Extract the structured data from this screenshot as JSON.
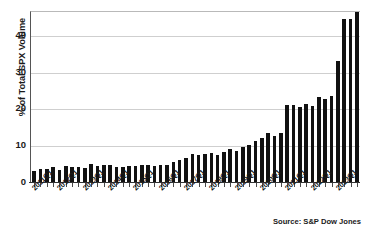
{
  "title_fragment": "",
  "source_note": "Source: S&P Dow Jones",
  "axis": {
    "ylabel": "% of Total SPX Volume",
    "yticks": [
      "0",
      "10",
      "20",
      "30",
      "40"
    ]
  },
  "chart_data": {
    "type": "bar",
    "title": "",
    "xlabel": "",
    "ylabel": "% of Total SPX Volume",
    "ylim": [
      0,
      46.5
    ],
    "yticks": [
      0,
      10,
      20,
      30,
      40
    ],
    "grid": true,
    "legend": false,
    "bar_color": "#111111",
    "source": "Source: S&P Dow Jones",
    "categories": [
      "2011Q1",
      "2011Q2",
      "2011Q3",
      "2011Q4",
      "2012Q1",
      "2012Q2",
      "2012Q3",
      "2012Q4",
      "2013Q1",
      "2013Q2",
      "2013Q3",
      "2013Q4",
      "2014Q1",
      "2014Q2",
      "2014Q3",
      "2014Q4",
      "2015Q1",
      "2015Q2",
      "2015Q3",
      "2015Q4",
      "2016Q1",
      "2016Q2",
      "2016Q3",
      "2016Q4",
      "2017Q1",
      "2017Q2",
      "2017Q3",
      "2017Q4",
      "2018Q1",
      "2018Q2",
      "2018Q3",
      "2018Q4",
      "2019Q1",
      "2019Q2",
      "2019Q3",
      "2019Q4",
      "2020Q1",
      "2020Q2",
      "2020Q3",
      "2020Q4",
      "2021Q1",
      "2021Q2",
      "2021Q3",
      "2021Q4",
      "2022Q1",
      "2022Q2",
      "2022Q3",
      "2022Q4",
      "2023Q1"
    ],
    "values": [
      3.1,
      3.5,
      3.6,
      4.1,
      3.2,
      4.4,
      4.1,
      4.2,
      3.7,
      4.8,
      4.4,
      4.5,
      4.5,
      4.2,
      4.2,
      4.3,
      4.4,
      4.6,
      4.6,
      4.3,
      4.6,
      4.6,
      5.4,
      6.1,
      6.4,
      7.5,
      7.3,
      7.7,
      7.8,
      7.4,
      8.2,
      8.9,
      8.5,
      9.5,
      10.2,
      11.2,
      12.0,
      13.3,
      12.4,
      13.3,
      20.9,
      21.0,
      20.4,
      21.1,
      20.8,
      23.1,
      22.5,
      23.5,
      33.0
    ],
    "tick_labels_shown": [
      "2011Q1",
      "2012Q1",
      "2013Q1",
      "2014Q1",
      "2015Q1",
      "2016Q1",
      "2017Q1",
      "2018Q1",
      "2019Q1",
      "2020Q1",
      "2021Q1",
      "2022Q1",
      "2023Q1"
    ],
    "extra_values_tail": [
      44.2,
      44.3,
      46.3
    ],
    "values_full": [
      3.1,
      3.5,
      3.6,
      4.1,
      3.2,
      4.4,
      4.1,
      4.2,
      3.7,
      4.8,
      4.4,
      4.5,
      4.5,
      4.2,
      4.2,
      4.3,
      4.4,
      4.6,
      4.6,
      4.3,
      4.6,
      4.6,
      5.4,
      6.1,
      6.4,
      7.5,
      7.3,
      7.7,
      7.8,
      7.4,
      8.2,
      8.9,
      8.5,
      9.5,
      10.2,
      11.2,
      12.0,
      13.3,
      12.4,
      13.3,
      20.9,
      21.0,
      20.4,
      21.1,
      20.8,
      23.1,
      22.5,
      23.5,
      33.0,
      44.2,
      44.3,
      46.3
    ]
  }
}
